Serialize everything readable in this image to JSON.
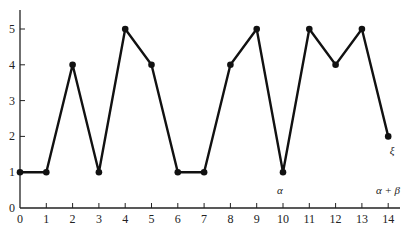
{
  "chart_data": {
    "type": "line",
    "title": "",
    "xlabel": "",
    "ylabel": "",
    "x": [
      0,
      1,
      2,
      3,
      4,
      5,
      6,
      7,
      8,
      9,
      10,
      11,
      12,
      13,
      14
    ],
    "values": [
      1,
      1,
      4,
      1,
      5,
      4,
      1,
      1,
      4,
      5,
      1,
      5,
      4,
      5,
      2
    ],
    "series": [
      {
        "name": "sequence",
        "values": [
          1,
          1,
          4,
          1,
          5,
          4,
          1,
          1,
          4,
          5,
          1,
          5,
          4,
          5,
          2
        ]
      }
    ],
    "xlim": [
      0,
      14
    ],
    "ylim": [
      0,
      5.5
    ],
    "x_ticks": [
      "0",
      "1",
      "2",
      "3",
      "4",
      "5",
      "6",
      "7",
      "8",
      "9",
      "10",
      "11",
      "12",
      "13",
      "14"
    ],
    "y_ticks": [
      "0",
      "1",
      "2",
      "3",
      "4",
      "5"
    ],
    "annotations": [
      {
        "text": "α",
        "x": 10,
        "position": "above x-axis"
      },
      {
        "text": "α + β",
        "x": 14,
        "position": "above x-axis"
      },
      {
        "text": "ξ",
        "x": 14,
        "y": 2,
        "position": "above-right of last point"
      }
    ],
    "grid": false,
    "legend": null,
    "markers": "filled circles",
    "line_color": "#111111"
  },
  "labels": {
    "alpha": "α",
    "alpha_plus_beta": "α + β",
    "xi": "ξ"
  }
}
